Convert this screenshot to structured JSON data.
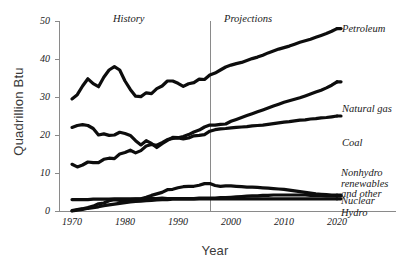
{
  "chart_data": {
    "type": "line",
    "title": "",
    "xlabel": "Year",
    "ylabel": "Quadrillion Btu",
    "xlim": [
      1970,
      2020
    ],
    "ylim": [
      0,
      50
    ],
    "grid": false,
    "legend_position": "right-of-line-ends",
    "x_ticks": [
      "1970",
      "1980",
      "1990",
      "2000",
      "2010",
      "2020"
    ],
    "y_ticks": [
      "0",
      "10",
      "20",
      "30",
      "40",
      "50"
    ],
    "annotations": [
      {
        "name": "history",
        "text": "History",
        "x": 1984
      },
      {
        "name": "projections",
        "text": "Projections",
        "x": 2005
      },
      {
        "name": "divider",
        "text": "",
        "x": 1997
      }
    ],
    "x": [
      1970,
      1971,
      1972,
      1973,
      1974,
      1975,
      1976,
      1977,
      1978,
      1979,
      1980,
      1981,
      1982,
      1983,
      1984,
      1985,
      1986,
      1987,
      1988,
      1989,
      1990,
      1991,
      1992,
      1993,
      1994,
      1995,
      1996,
      1997,
      1998,
      1999,
      2000,
      2001,
      2002,
      2003,
      2004,
      2005,
      2006,
      2007,
      2008,
      2009,
      2010,
      2011,
      2012,
      2013,
      2014,
      2015,
      2016,
      2017,
      2018,
      2019,
      2020
    ],
    "series": [
      {
        "name": "Petroleum",
        "label": "Petroleum",
        "values": [
          29.5,
          30.6,
          32.9,
          34.8,
          33.5,
          32.7,
          35.2,
          37.1,
          38.0,
          37.1,
          34.2,
          32.0,
          30.2,
          30.1,
          31.1,
          30.9,
          32.2,
          32.9,
          34.2,
          34.2,
          33.6,
          32.8,
          33.5,
          33.8,
          34.7,
          34.6,
          35.8,
          36.3,
          37.1,
          37.9,
          38.4,
          38.8,
          39.1,
          39.6,
          40.1,
          40.5,
          41.0,
          41.6,
          42.1,
          42.6,
          43.0,
          43.4,
          43.9,
          44.4,
          44.8,
          45.2,
          45.7,
          46.2,
          46.7,
          47.3,
          48.0
        ]
      },
      {
        "name": "Natural gas",
        "label": "Natural gas",
        "values": [
          22.0,
          22.5,
          22.7,
          22.5,
          21.7,
          20.0,
          20.3,
          19.9,
          20.0,
          20.7,
          20.4,
          19.9,
          18.5,
          17.4,
          18.5,
          17.8,
          16.7,
          17.7,
          18.6,
          19.4,
          19.3,
          19.6,
          20.1,
          20.8,
          21.3,
          22.1,
          22.6,
          22.6,
          22.8,
          22.9,
          23.6,
          24.1,
          24.6,
          25.1,
          25.6,
          26.1,
          26.6,
          27.1,
          27.6,
          28.1,
          28.6,
          29.0,
          29.4,
          29.8,
          30.3,
          30.8,
          31.3,
          31.8,
          32.4,
          33.1,
          34.0
        ]
      },
      {
        "name": "Coal",
        "label": "Coal",
        "values": [
          12.3,
          11.6,
          12.1,
          12.9,
          12.7,
          12.7,
          13.6,
          13.9,
          13.8,
          15.0,
          15.4,
          16.0,
          15.3,
          15.9,
          17.1,
          17.5,
          17.3,
          18.0,
          18.8,
          19.1,
          19.2,
          19.0,
          19.2,
          19.8,
          19.9,
          20.1,
          21.0,
          21.4,
          21.6,
          21.7,
          21.9,
          22.0,
          22.1,
          22.2,
          22.4,
          22.5,
          22.6,
          22.8,
          23.0,
          23.2,
          23.4,
          23.5,
          23.7,
          23.9,
          24.0,
          24.2,
          24.3,
          24.5,
          24.6,
          24.8,
          25.0
        ]
      },
      {
        "name": "Nonhydro renewables and other",
        "label": "Nonhydro renewables and other",
        "label_lines": [
          "Nonhydro",
          "renewables",
          "and other"
        ],
        "values": [
          0.1,
          0.4,
          0.6,
          0.9,
          1.3,
          1.9,
          2.1,
          2.7,
          3.0,
          2.8,
          2.7,
          3.0,
          3.1,
          3.2,
          3.6,
          4.1,
          4.5,
          4.9,
          5.6,
          5.7,
          6.1,
          6.4,
          6.5,
          6.5,
          6.8,
          7.2,
          7.2,
          6.7,
          6.5,
          6.6,
          6.6,
          6.5,
          6.4,
          6.3,
          6.3,
          6.2,
          6.1,
          6.0,
          5.9,
          5.8,
          5.7,
          5.5,
          5.3,
          5.1,
          4.9,
          4.7,
          4.5,
          4.4,
          4.3,
          4.2,
          4.2
        ]
      },
      {
        "name": "Nuclear",
        "label": "Nuclear",
        "values": [
          3.0,
          3.0,
          3.0,
          3.0,
          3.1,
          3.1,
          3.1,
          3.1,
          3.2,
          3.2,
          3.2,
          3.2,
          3.2,
          3.2,
          3.3,
          3.3,
          3.3,
          3.4,
          3.3,
          3.3,
          3.3,
          3.3,
          3.3,
          3.3,
          3.4,
          3.4,
          3.4,
          3.4,
          3.5,
          3.5,
          3.6,
          3.7,
          3.8,
          3.9,
          4.0,
          4.0,
          4.1,
          4.1,
          4.2,
          4.2,
          4.2,
          4.2,
          4.2,
          4.2,
          4.2,
          4.1,
          4.1,
          4.1,
          4.0,
          4.0,
          4.0
        ]
      },
      {
        "name": "Hydro",
        "label": "Hydro",
        "values": [
          0.0,
          0.2,
          0.4,
          0.7,
          0.9,
          1.1,
          1.4,
          1.6,
          1.8,
          2.0,
          2.2,
          2.4,
          2.5,
          2.6,
          2.7,
          2.8,
          2.9,
          3.0,
          3.0,
          3.1,
          3.1,
          3.1,
          3.1,
          3.1,
          3.2,
          3.2,
          3.2,
          3.2,
          3.2,
          3.2,
          3.2,
          3.2,
          3.2,
          3.2,
          3.2,
          3.2,
          3.2,
          3.2,
          3.2,
          3.2,
          3.2,
          3.2,
          3.2,
          3.2,
          3.2,
          3.2,
          3.2,
          3.2,
          3.2,
          3.2,
          3.2
        ]
      }
    ]
  }
}
